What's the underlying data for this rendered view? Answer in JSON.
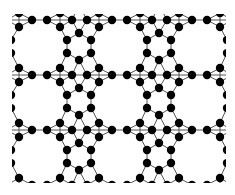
{
  "diagram": {
    "type": "periodic-graph-lattice",
    "colors": {
      "background": "#ffffff",
      "node": "#000000",
      "edge": "#555555"
    },
    "canvas": {
      "width": 235,
      "height": 195
    },
    "clip": {
      "x": 12,
      "y": 14,
      "width": 214,
      "height": 169
    },
    "node_radius": 4.2,
    "period": {
      "dx": 80,
      "dy": 55
    },
    "repeat": {
      "i_min": -1,
      "i_max": 3,
      "j_min": -1,
      "j_max": 3
    },
    "unit_cell_nodes": [
      [
        32,
        20
      ],
      [
        47,
        20
      ],
      [
        72,
        20
      ],
      [
        87,
        20
      ],
      [
        60,
        27
      ],
      [
        99,
        27
      ],
      [
        79,
        33
      ],
      [
        67,
        40
      ],
      [
        91,
        40
      ],
      [
        67,
        53
      ],
      [
        91,
        53
      ],
      [
        79,
        60
      ],
      [
        60,
        68
      ],
      [
        99,
        68
      ]
    ],
    "unit_cell_edges": [
      [
        0,
        1,
        0,
        0
      ],
      [
        1,
        2,
        0,
        0
      ],
      [
        2,
        3,
        0,
        0
      ],
      [
        3,
        0,
        1,
        0
      ],
      [
        1,
        4,
        0,
        0
      ],
      [
        4,
        2,
        0,
        0
      ],
      [
        3,
        5,
        0,
        0
      ],
      [
        5,
        0,
        1,
        0
      ],
      [
        2,
        6,
        0,
        0
      ],
      [
        3,
        6,
        0,
        0
      ],
      [
        6,
        7,
        0,
        0
      ],
      [
        6,
        8,
        0,
        0
      ],
      [
        4,
        7,
        0,
        0
      ],
      [
        5,
        8,
        0,
        0
      ],
      [
        7,
        9,
        0,
        0
      ],
      [
        8,
        10,
        0,
        0
      ],
      [
        9,
        11,
        0,
        0
      ],
      [
        10,
        11,
        0,
        0
      ],
      [
        9,
        12,
        0,
        0
      ],
      [
        10,
        13,
        0,
        0
      ],
      [
        12,
        1,
        0,
        1
      ],
      [
        12,
        2,
        0,
        1
      ],
      [
        13,
        3,
        0,
        1
      ],
      [
        13,
        0,
        1,
        1
      ],
      [
        11,
        2,
        0,
        1
      ],
      [
        11,
        3,
        0,
        1
      ],
      [
        12,
        4,
        0,
        1
      ],
      [
        13,
        5,
        0,
        1
      ]
    ],
    "edge_format": "[from_node, to_node, to_cell_di, to_cell_dj]"
  }
}
